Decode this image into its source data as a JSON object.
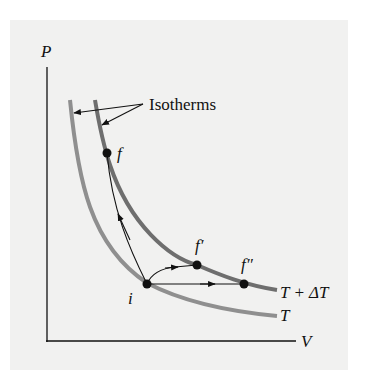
{
  "diagram": {
    "axes": {
      "y_label": "P",
      "x_label": "V"
    },
    "callout": {
      "label": "Isotherms"
    },
    "curves": [
      {
        "id": "T",
        "label": "T",
        "color": "#8f8f8f"
      },
      {
        "id": "T_plus_dT",
        "label": "T + ΔT",
        "color": "#6e6e6e"
      }
    ],
    "points": [
      {
        "id": "i",
        "label": "i"
      },
      {
        "id": "f",
        "label": "f"
      },
      {
        "id": "f_prime",
        "label": "f′"
      },
      {
        "id": "f_double_prime",
        "label": "f″"
      }
    ],
    "colors": {
      "background": "#f1f1f0",
      "ink": "#111111"
    }
  }
}
